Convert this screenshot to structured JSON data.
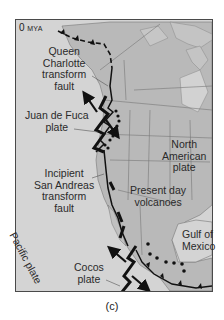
{
  "figure": {
    "era_label": {
      "value": "0",
      "unit": "MYA"
    },
    "caption": "(c)",
    "labels": {
      "queen_charlotte": [
        "Queen",
        "Charlotte",
        "transform",
        "fault"
      ],
      "juan_de_fuca": [
        "Juan de Fuca",
        "plate"
      ],
      "san_andreas": [
        "Incipient",
        "San Andreas",
        "transform",
        "fault"
      ],
      "north_american": [
        "North",
        "American",
        "plate"
      ],
      "volcanoes": [
        "Present day",
        "volcanoes"
      ],
      "pacific": "Pacific plate",
      "cocos": [
        "Cocos",
        "plate"
      ],
      "gulf": [
        "Gulf of",
        "Mexico"
      ]
    },
    "colors": {
      "ocean": "#d4d4d4",
      "land": "#b8b8b8",
      "boundary": "#111111",
      "frame": "#4a4a4a"
    },
    "symbols": {
      "subduction": "line-with-triangles",
      "transform": "zigzag-line-with-opposing-arrows",
      "volcano": "black-dot"
    }
  }
}
